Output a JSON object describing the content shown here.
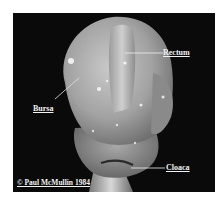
{
  "figure": {
    "labels": {
      "rectum": "Rectum",
      "bursa": "Bursa",
      "cloaca": "Cloaca"
    },
    "copyright": "© Paul McMullin 1984"
  },
  "colors": {
    "background": "#0a0a0a",
    "label_text": "#f2f2f2",
    "tissue_light": "#c8c8c8",
    "tissue_mid": "#9a9a9a",
    "page": "#ffffff"
  }
}
